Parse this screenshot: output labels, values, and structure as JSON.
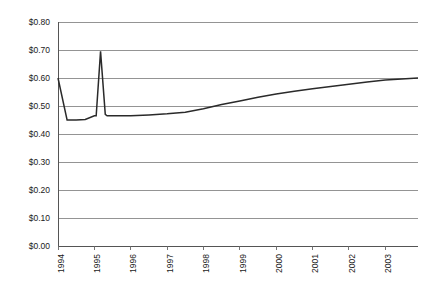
{
  "chart_data": {
    "type": "line",
    "title": "",
    "subtitle": "",
    "xlabel": "",
    "ylabel": "",
    "grid": true,
    "legend": false,
    "legend_position": "none",
    "line_color": "#2a2a2a",
    "grid_color": "#888888",
    "background_color": "#ffffff",
    "xlim": [
      1994,
      2003.9
    ],
    "ylim": [
      0.0,
      0.8
    ],
    "ytick_values": [
      0.0,
      0.1,
      0.2,
      0.3,
      0.4,
      0.5,
      0.6,
      0.7,
      0.8
    ],
    "ytick_labels": [
      "$0.00",
      "$0.10",
      "$0.20",
      "$0.30",
      "$0.40",
      "$0.50",
      "$0.60",
      "$0.70",
      "$0.80"
    ],
    "xtick_values": [
      1994,
      1995,
      1996,
      1997,
      1998,
      1999,
      2000,
      2001,
      2002,
      2003
    ],
    "xtick_labels": [
      "1994",
      "1995",
      "1996",
      "1997",
      "1998",
      "1999",
      "2000",
      "2001",
      "2002",
      "2003"
    ],
    "xtick_rotation": 90,
    "series": [
      {
        "name": "price",
        "x": [
          1994.0,
          1994.25,
          1994.5,
          1994.75,
          1995.0,
          1995.05,
          1995.17,
          1995.3,
          1995.35,
          1995.75,
          1996.0,
          1996.5,
          1997.0,
          1997.5,
          1998.0,
          1998.5,
          1999.0,
          1999.5,
          2000.0,
          2000.5,
          2001.0,
          2001.5,
          2002.0,
          2002.5,
          2003.0,
          2003.9
        ],
        "values": [
          0.6,
          0.45,
          0.45,
          0.452,
          0.465,
          0.465,
          0.695,
          0.47,
          0.465,
          0.465,
          0.465,
          0.468,
          0.472,
          0.478,
          0.49,
          0.505,
          0.518,
          0.531,
          0.543,
          0.553,
          0.562,
          0.57,
          0.578,
          0.586,
          0.593,
          0.6
        ]
      }
    ]
  }
}
